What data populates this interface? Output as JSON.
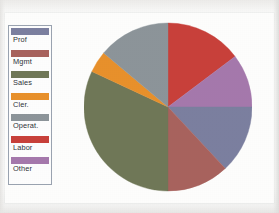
{
  "figure": {
    "background_color": "#fdfdfc",
    "page_color": "#fafaf9"
  },
  "legend": {
    "border_color": "#9aa3b0",
    "background_color": "#fdfdfd",
    "items": [
      {
        "label": "Prof",
        "color": "#7b7f9f"
      },
      {
        "label": "Mgmt",
        "color": "#a8625d"
      },
      {
        "label": "Sales",
        "color": "#6f7757"
      },
      {
        "label": "Cler.",
        "color": "#e8902b"
      },
      {
        "label": "Operat.",
        "color": "#8c9499"
      },
      {
        "label": "Labor",
        "color": "#c8403a"
      },
      {
        "label": "Other",
        "color": "#a униф"
      }
    ]
  },
  "chart_data": {
    "type": "pie",
    "title": "",
    "legend_position": "left",
    "grid": false,
    "start_angle_deg": 0,
    "direction": "clockwise",
    "categories": [
      "Labor",
      "Other",
      "Prof",
      "Mgmt",
      "Sales",
      "Cler.",
      "Operat."
    ],
    "values": [
      14.7,
      10.3,
      13.1,
      11.9,
      31.9,
      4.2,
      13.9
    ],
    "unit": "percent",
    "slices": [
      {
        "label": "Labor",
        "color": "#c8403a",
        "percent": 14.7,
        "angle_deg": 53,
        "start_deg": 0,
        "end_deg": 53
      },
      {
        "label": "Other",
        "color": "#a578ac",
        "percent": 10.3,
        "angle_deg": 37,
        "start_deg": 53,
        "end_deg": 90
      },
      {
        "label": "Prof",
        "color": "#7b7f9f",
        "percent": 13.1,
        "angle_deg": 47,
        "start_deg": 90,
        "end_deg": 137
      },
      {
        "label": "Mgmt",
        "color": "#a8625d",
        "percent": 11.9,
        "angle_deg": 43,
        "start_deg": 137,
        "end_deg": 180
      },
      {
        "label": "Sales",
        "color": "#6f7757",
        "percent": 31.9,
        "angle_deg": 115,
        "start_deg": 180,
        "end_deg": 295
      },
      {
        "label": "Cler.",
        "color": "#e8902b",
        "percent": 4.2,
        "angle_deg": 15,
        "start_deg": 295,
        "end_deg": 310
      },
      {
        "label": "Operat.",
        "color": "#8c9499",
        "percent": 13.9,
        "angle_deg": 50,
        "start_deg": 310,
        "end_deg": 360
      }
    ]
  }
}
